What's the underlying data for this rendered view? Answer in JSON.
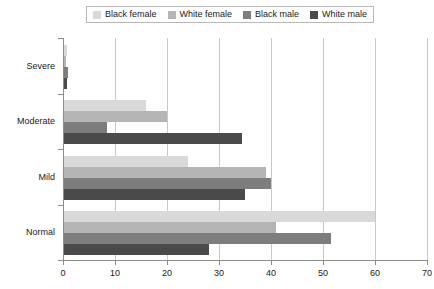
{
  "legend": {
    "position": "top",
    "items": [
      {
        "label": "Black female",
        "color": "#d9d9d9",
        "icon": "legend-swatch-icon"
      },
      {
        "label": "White female",
        "color": "#b5b5b5",
        "icon": "legend-swatch-icon"
      },
      {
        "label": "Black male",
        "color": "#7d7d7d",
        "icon": "legend-swatch-icon"
      },
      {
        "label": "White male",
        "color": "#4a4a4a",
        "icon": "legend-swatch-icon"
      }
    ]
  },
  "chart_data": {
    "type": "bar",
    "orientation": "horizontal",
    "title": "",
    "xlabel": "",
    "ylabel": "",
    "xlim": [
      0,
      70
    ],
    "ylim": null,
    "grid": true,
    "xticks": [
      0,
      10,
      20,
      30,
      40,
      50,
      60,
      70
    ],
    "categories": [
      "Severe",
      "Moderate",
      "Mild",
      "Normal"
    ],
    "series": [
      {
        "name": "Black female",
        "color": "#d9d9d9",
        "values": [
          0.8,
          16.0,
          24.0,
          60.0
        ]
      },
      {
        "name": "White female",
        "color": "#b5b5b5",
        "values": [
          0.6,
          20.0,
          39.0,
          41.0
        ]
      },
      {
        "name": "Black male",
        "color": "#7d7d7d",
        "values": [
          0.9,
          8.5,
          40.0,
          51.5
        ]
      },
      {
        "name": "White male",
        "color": "#4a4a4a",
        "values": [
          0.7,
          34.5,
          35.0,
          28.0
        ]
      }
    ]
  },
  "axes": {
    "x_tick_labels": [
      "0",
      "10",
      "20",
      "30",
      "40",
      "50",
      "60",
      "70"
    ],
    "y_tick_labels": [
      "Severe",
      "Moderate",
      "Mild",
      "Normal"
    ]
  }
}
